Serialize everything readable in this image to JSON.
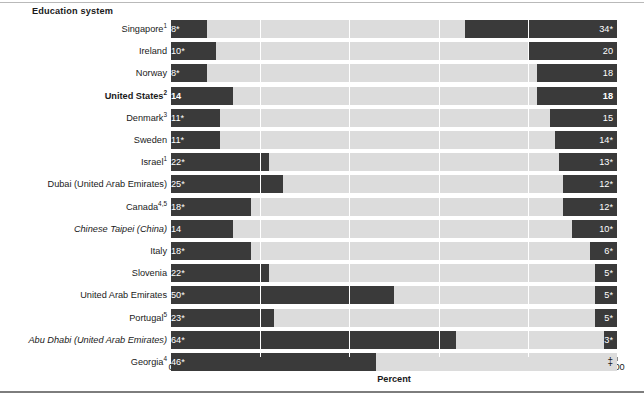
{
  "chart_data": {
    "type": "bar",
    "subtype": "diverging-stacked-bar",
    "title": "",
    "header_label": "Education system",
    "xlabel": "Percent",
    "ylabel": "",
    "xlim": [
      0,
      100
    ],
    "xticks": [
      0,
      20,
      40,
      60,
      80,
      100
    ],
    "xticklabels": [
      "0",
      "20",
      "40",
      "60",
      "80",
      "100"
    ],
    "grid": true,
    "gridline_positions": [
      20,
      40,
      60,
      80
    ],
    "legend": "",
    "colors": {
      "dark_segment": "#3a3a3a",
      "light_segment": "#dcdcdc",
      "background": "#ffffff",
      "axis": "#8c8c8c",
      "text": "#1a1a1a",
      "label_text": "#ffffff"
    },
    "categories": [
      "Singapore",
      "Ireland",
      "Norway",
      "United States",
      "Denmark",
      "Sweden",
      "Israel",
      "Dubai (United Arab Emirates)",
      "Canada",
      "Chinese Taipei (China)",
      "Italy",
      "Slovenia",
      "United Arab Emirates",
      "Portugal",
      "Abu Dhabi (United Arab Emirates)",
      "Georgia"
    ],
    "series": [
      {
        "name": "Left (low) segment",
        "values": [
          8,
          10,
          8,
          14,
          11,
          11,
          22,
          25,
          18,
          14,
          18,
          22,
          50,
          23,
          64,
          46
        ]
      },
      {
        "name": "Right (high) segment",
        "values": [
          34,
          20,
          18,
          18,
          15,
          14,
          13,
          12,
          12,
          10,
          6,
          5,
          5,
          5,
          3,
          null
        ]
      }
    ]
  },
  "header": {
    "label": "Education system"
  },
  "axis": {
    "title": "Percent",
    "ticks": [
      {
        "value": 0,
        "label": "0"
      },
      {
        "value": 20,
        "label": "20"
      },
      {
        "value": 40,
        "label": "40"
      },
      {
        "value": 60,
        "label": "60"
      },
      {
        "value": 80,
        "label": "80"
      },
      {
        "value": 100,
        "label": "100"
      }
    ]
  },
  "rows": [
    {
      "name": "Singapore",
      "sup": "1",
      "style": "normal",
      "left_value": 8,
      "left_label": "8*",
      "right_value": 34,
      "right_label": "34*",
      "right_bold": false
    },
    {
      "name": "Ireland",
      "sup": "",
      "style": "normal",
      "left_value": 10,
      "left_label": "10*",
      "right_value": 20,
      "right_label": "20",
      "right_bold": false
    },
    {
      "name": "Norway",
      "sup": "",
      "style": "normal",
      "left_value": 8,
      "left_label": "8*",
      "right_value": 18,
      "right_label": "18",
      "right_bold": false
    },
    {
      "name": "United States",
      "sup": "2",
      "style": "bold",
      "left_value": 14,
      "left_label": "14",
      "right_value": 18,
      "right_label": "18",
      "right_bold": true
    },
    {
      "name": "Denmark",
      "sup": "3",
      "style": "normal",
      "left_value": 11,
      "left_label": "11*",
      "right_value": 15,
      "right_label": "15",
      "right_bold": false
    },
    {
      "name": "Sweden",
      "sup": "",
      "style": "normal",
      "left_value": 11,
      "left_label": "11*",
      "right_value": 14,
      "right_label": "14*",
      "right_bold": false
    },
    {
      "name": "Israel",
      "sup": "1",
      "style": "normal",
      "left_value": 22,
      "left_label": "22*",
      "right_value": 13,
      "right_label": "13*",
      "right_bold": false
    },
    {
      "name": "Dubai (United Arab Emirates)",
      "sup": "",
      "style": "normal",
      "left_value": 25,
      "left_label": "25*",
      "right_value": 12,
      "right_label": "12*",
      "right_bold": false
    },
    {
      "name": "Canada",
      "sup": "4,5",
      "style": "normal",
      "left_value": 18,
      "left_label": "18*",
      "right_value": 12,
      "right_label": "12*",
      "right_bold": false
    },
    {
      "name": "Chinese Taipei (China)",
      "sup": "",
      "style": "italic",
      "left_value": 14,
      "left_label": "14",
      "right_value": 10,
      "right_label": "10*",
      "right_bold": false
    },
    {
      "name": "Italy",
      "sup": "",
      "style": "normal",
      "left_value": 18,
      "left_label": "18*",
      "right_value": 6,
      "right_label": "6*",
      "right_bold": false
    },
    {
      "name": "Slovenia",
      "sup": "",
      "style": "normal",
      "left_value": 22,
      "left_label": "22*",
      "right_value": 5,
      "right_label": "5*",
      "right_bold": false
    },
    {
      "name": "United Arab Emirates",
      "sup": "",
      "style": "normal",
      "left_value": 50,
      "left_label": "50*",
      "right_value": 5,
      "right_label": "5*",
      "right_bold": false
    },
    {
      "name": "Portugal",
      "sup": "5",
      "style": "normal",
      "left_value": 23,
      "left_label": "23*",
      "right_value": 5,
      "right_label": "5*",
      "right_bold": false
    },
    {
      "name": "Abu Dhabi (United Arab Emirates)",
      "sup": "",
      "style": "italic",
      "left_value": 64,
      "left_label": "64*",
      "right_value": 3,
      "right_label": "3*",
      "right_bold": false
    },
    {
      "name": "Georgia",
      "sup": "4",
      "style": "normal",
      "left_value": 46,
      "left_label": "46*",
      "right_value": 0,
      "right_label": "‡",
      "right_bold": false
    }
  ]
}
